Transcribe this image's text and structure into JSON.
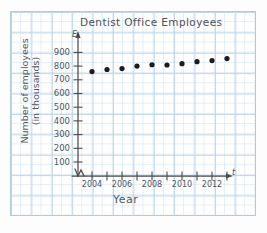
{
  "chart_data": {
    "type": "scatter",
    "title": "Dentist Office Employees",
    "xlabel": "Year",
    "ylabel_line1": "Number of employees",
    "ylabel_line2": "(in thousands)",
    "x_axis_variable": "t",
    "y_axis_variable": "E",
    "x": [
      2004,
      2005,
      2006,
      2007,
      2008,
      2009,
      2010,
      2011,
      2012,
      2013
    ],
    "values": [
      760,
      775,
      782,
      800,
      810,
      808,
      818,
      832,
      840,
      855
    ],
    "xlim": [
      2003.4,
      2013.8
    ],
    "ylim": [
      0,
      950
    ],
    "x_tick_labels": [
      "2004",
      "2006",
      "2008",
      "2010",
      "2012"
    ],
    "x_tick_years": [
      2004,
      2005,
      2006,
      2007,
      2008,
      2009,
      2010,
      2011,
      2012,
      2013
    ],
    "y_tick_labels": [
      "900",
      "800",
      "700",
      "600",
      "500",
      "400",
      "300",
      "200",
      "100"
    ],
    "y_tick_values": [
      900,
      800,
      700,
      600,
      500,
      400,
      300,
      200,
      100
    ],
    "grid": true,
    "grid_color": "#bcd6ea",
    "axis_color": "#4a4a52",
    "marker_color": "#1b1b20",
    "axis_break": true,
    "legend": "none"
  }
}
